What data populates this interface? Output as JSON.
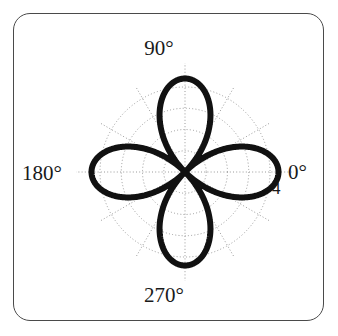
{
  "figure": {
    "type": "polar-rose-plot",
    "background_color": "#ffffff",
    "frame": {
      "shape": "rounded-rectangle",
      "border_color": "#4a4a4a"
    }
  },
  "angle_labels": {
    "right": "0°",
    "top": "90°",
    "left": "180°",
    "bottom": "270°"
  },
  "radial_labels": {
    "outer": "4"
  },
  "chart_data": {
    "type": "line",
    "title": "",
    "xlabel": "",
    "ylabel": "",
    "coordinate_system": "polar",
    "angle_unit": "degrees",
    "angle_tick_labels": [
      "0°",
      "90°",
      "180°",
      "270°"
    ],
    "angle_tick_values": [
      0,
      90,
      180,
      270
    ],
    "angle_spoke_interval_deg": 30,
    "radial_tick_labels": [
      "4"
    ],
    "radial_ticks": [
      1,
      2,
      3,
      4
    ],
    "radial_grid_circles": 4,
    "rlim": [
      0,
      4
    ],
    "grid": true,
    "grid_style": "dotted",
    "legend_position": "none",
    "series": [
      {
        "name": "four-petal rose",
        "description": "Four symmetric lobes pointing along 0, 90, 180 and 270 degrees; peak radius ~4.4 exceeds the outer r=4 grid circle.",
        "equation": "r = 4.4 * cos(2*theta) (absolute value, four lobes)",
        "peak_radius": 4.4,
        "lobe_directions_deg": [
          0,
          90,
          180,
          270
        ],
        "points": [
          {
            "theta": 0,
            "r": 4.4
          },
          {
            "theta": 10,
            "r": 4.15
          },
          {
            "theta": 20,
            "r": 3.42
          },
          {
            "theta": 30,
            "r": 2.3
          },
          {
            "theta": 40,
            "r": 1.02
          },
          {
            "theta": 45,
            "r": 0.0
          },
          {
            "theta": 50,
            "r": 1.02
          },
          {
            "theta": 60,
            "r": 2.3
          },
          {
            "theta": 70,
            "r": 3.42
          },
          {
            "theta": 80,
            "r": 4.15
          },
          {
            "theta": 90,
            "r": 4.4
          },
          {
            "theta": 100,
            "r": 4.15
          },
          {
            "theta": 110,
            "r": 3.42
          },
          {
            "theta": 120,
            "r": 2.3
          },
          {
            "theta": 130,
            "r": 1.02
          },
          {
            "theta": 135,
            "r": 0.0
          },
          {
            "theta": 140,
            "r": 1.02
          },
          {
            "theta": 150,
            "r": 2.3
          },
          {
            "theta": 160,
            "r": 3.42
          },
          {
            "theta": 170,
            "r": 4.15
          },
          {
            "theta": 180,
            "r": 4.4
          },
          {
            "theta": 190,
            "r": 4.15
          },
          {
            "theta": 200,
            "r": 3.42
          },
          {
            "theta": 210,
            "r": 2.3
          },
          {
            "theta": 220,
            "r": 1.02
          },
          {
            "theta": 225,
            "r": 0.0
          },
          {
            "theta": 230,
            "r": 1.02
          },
          {
            "theta": 240,
            "r": 2.3
          },
          {
            "theta": 250,
            "r": 3.42
          },
          {
            "theta": 260,
            "r": 4.15
          },
          {
            "theta": 270,
            "r": 4.4
          },
          {
            "theta": 280,
            "r": 4.15
          },
          {
            "theta": 290,
            "r": 3.42
          },
          {
            "theta": 300,
            "r": 2.3
          },
          {
            "theta": 310,
            "r": 1.02
          },
          {
            "theta": 315,
            "r": 0.0
          },
          {
            "theta": 320,
            "r": 1.02
          },
          {
            "theta": 330,
            "r": 2.3
          },
          {
            "theta": 340,
            "r": 3.42
          },
          {
            "theta": 350,
            "r": 4.15
          },
          {
            "theta": 360,
            "r": 4.4
          }
        ],
        "line_color": "#111111",
        "line_width": 6
      }
    ]
  }
}
